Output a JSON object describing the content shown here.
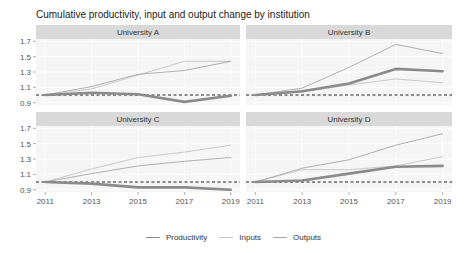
{
  "chart_data": {
    "type": "line",
    "title": "Cumulative productivity, input and output change by institution",
    "xlabel": "",
    "ylabel": "",
    "x": [
      2011,
      2013,
      2015,
      2017,
      2019
    ],
    "x_ticks": [
      "2011",
      "2013",
      "2015",
      "2017",
      "2019"
    ],
    "y_ticks": [
      "0.9",
      "1.1",
      "1.3",
      "1.5",
      "1.7"
    ],
    "ylim": [
      0.87,
      1.73
    ],
    "reference_line": {
      "y": 1.0,
      "style": "dashed"
    },
    "legend": {
      "position": "bottom",
      "entries": [
        "Productivity",
        "Inputs",
        "Outputs"
      ]
    },
    "grid": true,
    "facets": [
      {
        "label": "University A",
        "series": [
          {
            "name": "Productivity",
            "values": [
              1.0,
              1.03,
              1.01,
              0.91,
              0.99
            ]
          },
          {
            "name": "Inputs",
            "values": [
              1.0,
              1.08,
              1.26,
              1.44,
              1.44
            ]
          },
          {
            "name": "Outputs",
            "values": [
              1.0,
              1.11,
              1.27,
              1.32,
              1.44
            ]
          }
        ]
      },
      {
        "label": "University B",
        "series": [
          {
            "name": "Productivity",
            "values": [
              1.0,
              1.05,
              1.15,
              1.34,
              1.31
            ]
          },
          {
            "name": "Inputs",
            "values": [
              1.0,
              1.04,
              1.13,
              1.21,
              1.16
            ]
          },
          {
            "name": "Outputs",
            "values": [
              1.0,
              1.09,
              1.36,
              1.66,
              1.54
            ]
          }
        ]
      },
      {
        "label": "University C",
        "series": [
          {
            "name": "Productivity",
            "values": [
              1.0,
              0.98,
              0.93,
              0.93,
              0.9
            ]
          },
          {
            "name": "Inputs",
            "values": [
              1.0,
              1.17,
              1.32,
              1.39,
              1.48
            ]
          },
          {
            "name": "Outputs",
            "values": [
              1.0,
              1.11,
              1.21,
              1.27,
              1.32
            ]
          }
        ]
      },
      {
        "label": "University D",
        "series": [
          {
            "name": "Productivity",
            "values": [
              1.0,
              1.02,
              1.11,
              1.2,
              1.21
            ]
          },
          {
            "name": "Inputs",
            "values": [
              1.0,
              1.16,
              1.16,
              1.21,
              1.33
            ]
          },
          {
            "name": "Outputs",
            "values": [
              1.0,
              1.18,
              1.29,
              1.48,
              1.63
            ]
          }
        ]
      }
    ],
    "colors": {
      "Productivity": "#8a8a8a",
      "Inputs": "#c4c4c4",
      "Outputs": "#a8a8a8",
      "strip": "#d9d9d9",
      "panel": "#f5f5f5",
      "reference": "#222222"
    }
  },
  "legend": {
    "items": [
      {
        "label": "Productivity"
      },
      {
        "label": "Inputs"
      },
      {
        "label": "Outputs"
      }
    ]
  }
}
